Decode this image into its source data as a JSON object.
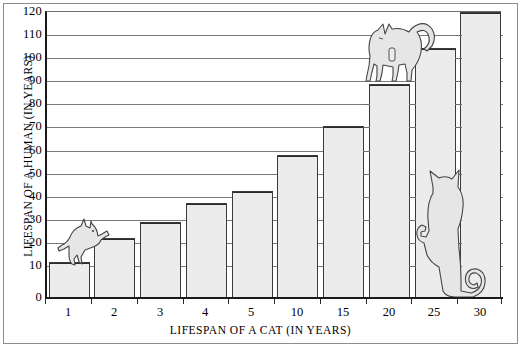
{
  "chart_data": {
    "type": "bar",
    "title": "",
    "xlabel": "LIFESPAN OF A CAT (IN YEARS)",
    "ylabel": "LIFESPAN OF A HUMAN (IN YEARS)",
    "categories": [
      "1",
      "2",
      "3",
      "4",
      "5",
      "10",
      "15",
      "20",
      "25",
      "30"
    ],
    "values": [
      15,
      25,
      32,
      40,
      45,
      60,
      72,
      90,
      105,
      120
    ],
    "ylim": [
      0,
      120
    ],
    "yticks": [
      0,
      10,
      20,
      30,
      40,
      50,
      60,
      70,
      80,
      90,
      100,
      110,
      120
    ],
    "ytick_labels": [
      "0",
      "10",
      "20",
      "30",
      "40",
      "50",
      "60",
      "70",
      "80",
      "90",
      "100",
      "110",
      "120"
    ],
    "grid": true,
    "legend": "none",
    "bar_fill": "#ececec",
    "bar_edge": "#3a3a3a",
    "grid_color": "#7a7a7a",
    "axis_color": "#1a1a1a",
    "annotations": [
      "cat-illustration-climbing-bar-1",
      "cat-illustration-standing-on-bar-20",
      "cat-illustration-sitting-beside-bar-30"
    ]
  }
}
